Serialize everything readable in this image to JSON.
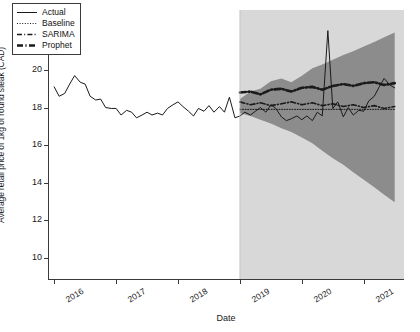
{
  "chart_data": {
    "type": "line",
    "title": "",
    "xlabel": "Date",
    "ylabel": "Average retail price of 1kg of round steak (CAD)",
    "ylim": [
      8.8,
      23.2
    ],
    "yticks": [
      10,
      12,
      14,
      16,
      18,
      20,
      22
    ],
    "xlim": [
      2015.9,
      2021.65
    ],
    "xticks": [
      2016,
      2017,
      2018,
      2019,
      2020,
      2021
    ],
    "xticklabels": [
      "2016",
      "2017",
      "2018",
      "2019",
      "2020",
      "2021"
    ],
    "grid": false,
    "legend_position": "upper left",
    "train_test_split_x": 2019.0,
    "test_shading_color": "#d8d8d8",
    "confidence_band_color": "#8c8c8c",
    "line_color": "#1a1a1a",
    "legend": [
      {
        "label": "Actual",
        "style": "solid"
      },
      {
        "label": "Baseline",
        "style": "dotted"
      },
      {
        "label": "SARIMA",
        "style": "dashdot"
      },
      {
        "label": "Prophet",
        "style": "dashdot-thick"
      }
    ],
    "series": [
      {
        "name": "Actual",
        "x": [
          2016.0,
          2016.08,
          2016.17,
          2016.25,
          2016.33,
          2016.42,
          2016.5,
          2016.58,
          2016.67,
          2016.75,
          2016.83,
          2016.92,
          2017.0,
          2017.08,
          2017.17,
          2017.25,
          2017.33,
          2017.42,
          2017.5,
          2017.58,
          2017.67,
          2017.75,
          2017.83,
          2017.92,
          2018.0,
          2018.08,
          2018.17,
          2018.25,
          2018.33,
          2018.42,
          2018.5,
          2018.58,
          2018.67,
          2018.75,
          2018.83,
          2018.92,
          2019.0,
          2019.08,
          2019.17,
          2019.25,
          2019.33,
          2019.42,
          2019.5,
          2019.58,
          2019.67,
          2019.75,
          2019.83,
          2019.92,
          2020.0,
          2020.08,
          2020.17,
          2020.25,
          2020.33,
          2020.42,
          2020.5,
          2020.58,
          2020.67,
          2020.75,
          2020.83,
          2020.92,
          2021.0,
          2021.08,
          2021.17,
          2021.25,
          2021.33,
          2021.42,
          2021.5
        ],
        "values": [
          19.1,
          18.6,
          18.75,
          19.25,
          19.7,
          19.35,
          19.25,
          18.6,
          18.4,
          18.45,
          18.0,
          17.95,
          17.95,
          17.6,
          17.85,
          17.75,
          17.45,
          17.6,
          17.75,
          17.6,
          17.7,
          17.6,
          17.95,
          18.15,
          18.3,
          18.05,
          17.8,
          17.55,
          17.95,
          17.8,
          18.1,
          17.75,
          18.05,
          17.75,
          18.55,
          17.45,
          17.55,
          17.75,
          17.6,
          17.8,
          18.0,
          17.75,
          18.15,
          17.95,
          17.5,
          17.3,
          17.4,
          17.55,
          17.35,
          17.55,
          17.3,
          17.75,
          17.55,
          22.1,
          17.95,
          18.3,
          17.5,
          18.0,
          17.6,
          17.85,
          17.8,
          18.35,
          18.6,
          19.1,
          19.55,
          19.2,
          19.05
        ]
      },
      {
        "name": "Baseline",
        "x": [
          2019.0,
          2019.5,
          2020.0,
          2020.5,
          2021.0,
          2021.5
        ],
        "values": [
          17.9,
          17.9,
          17.9,
          17.9,
          17.9,
          17.9
        ]
      },
      {
        "name": "SARIMA",
        "x": [
          2019.0,
          2019.17,
          2019.33,
          2019.5,
          2019.67,
          2019.83,
          2020.0,
          2020.17,
          2020.33,
          2020.5,
          2020.67,
          2020.83,
          2021.0,
          2021.17,
          2021.33,
          2021.5
        ],
        "values": [
          18.3,
          18.15,
          18.25,
          18.1,
          18.2,
          18.3,
          18.15,
          18.25,
          18.1,
          18.2,
          18.05,
          18.15,
          18.0,
          18.1,
          17.95,
          18.05
        ]
      },
      {
        "name": "Prophet",
        "x": [
          2019.0,
          2019.17,
          2019.33,
          2019.5,
          2019.67,
          2019.83,
          2020.0,
          2020.17,
          2020.33,
          2020.5,
          2020.67,
          2020.83,
          2021.0,
          2021.17,
          2021.33,
          2021.5
        ],
        "values": [
          18.8,
          18.85,
          18.7,
          18.95,
          19.0,
          18.85,
          19.05,
          19.1,
          18.95,
          19.15,
          19.25,
          19.15,
          19.3,
          19.35,
          19.2,
          19.3
        ]
      }
    ],
    "confidence_band": {
      "x": [
        2019.0,
        2019.17,
        2019.33,
        2019.5,
        2019.67,
        2019.83,
        2020.0,
        2020.17,
        2020.33,
        2020.5,
        2020.67,
        2020.83,
        2021.0,
        2021.17,
        2021.33,
        2021.5
      ],
      "upper": [
        18.45,
        18.85,
        19.0,
        19.4,
        19.55,
        19.35,
        19.7,
        20.1,
        20.3,
        20.55,
        20.8,
        21.0,
        21.25,
        21.5,
        21.75,
        22.0
      ],
      "lower": [
        17.7,
        17.55,
        17.35,
        17.15,
        16.9,
        16.7,
        16.4,
        16.1,
        15.7,
        15.3,
        14.95,
        14.55,
        14.15,
        13.75,
        13.35,
        12.95
      ]
    }
  }
}
